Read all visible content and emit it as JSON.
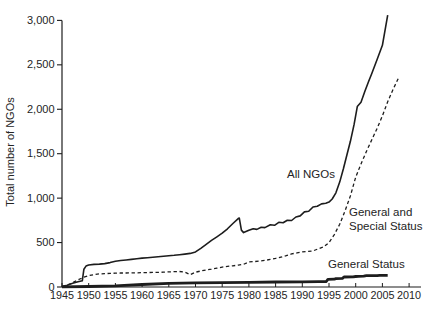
{
  "figure": {
    "background": "#ffffff",
    "ink_color": "#1d1d1d",
    "text_color": "#242424"
  },
  "chart_data": {
    "type": "line",
    "title": "",
    "xlabel": "",
    "ylabel": "Total number of NGOs",
    "xlim": [
      1945,
      2012
    ],
    "ylim": [
      0,
      3000
    ],
    "grid": false,
    "legend_position": "inline-annotations",
    "x_ticks": [
      1945,
      1950,
      1955,
      1960,
      1965,
      1970,
      1975,
      1980,
      1985,
      1990,
      1995,
      2000,
      2005,
      2010
    ],
    "x_tick_labels": [
      "1945",
      "1950",
      "1955",
      "1960",
      "1965",
      "1970",
      "1975",
      "1980",
      "1985",
      "1990",
      "1995",
      "2000",
      "2005",
      "2010"
    ],
    "y_ticks": [
      0,
      500,
      1000,
      1500,
      2000,
      2500,
      3000
    ],
    "y_tick_labels": [
      "0",
      "500",
      "1,000",
      "1,500",
      "2,000",
      "2,500",
      "3,000"
    ],
    "series": [
      {
        "name": "All NGOs",
        "style": "solid",
        "stroke_width": 1.6,
        "points": [
          [
            1945,
            5
          ],
          [
            1946,
            20
          ],
          [
            1947,
            42
          ],
          [
            1948,
            60
          ],
          [
            1948.8,
            70
          ],
          [
            1949.1,
            200
          ],
          [
            1949.5,
            235
          ],
          [
            1950,
            248
          ],
          [
            1951,
            254
          ],
          [
            1952,
            258
          ],
          [
            1953,
            263
          ],
          [
            1954,
            275
          ],
          [
            1955,
            290
          ],
          [
            1956,
            298
          ],
          [
            1957,
            304
          ],
          [
            1958,
            311
          ],
          [
            1959,
            317
          ],
          [
            1960,
            325
          ],
          [
            1961,
            330
          ],
          [
            1962,
            335
          ],
          [
            1963,
            340
          ],
          [
            1964,
            346
          ],
          [
            1965,
            352
          ],
          [
            1966,
            357
          ],
          [
            1967,
            363
          ],
          [
            1968,
            370
          ],
          [
            1969,
            378
          ],
          [
            1970,
            395
          ],
          [
            1971,
            435
          ],
          [
            1972,
            480
          ],
          [
            1973,
            525
          ],
          [
            1974,
            565
          ],
          [
            1975,
            605
          ],
          [
            1976,
            655
          ],
          [
            1977,
            715
          ],
          [
            1978,
            770
          ],
          [
            1978.2,
            775
          ],
          [
            1978.6,
            640
          ],
          [
            1979,
            612
          ],
          [
            1980,
            638
          ],
          [
            1980.8,
            656
          ],
          [
            1981.5,
            648
          ],
          [
            1982.3,
            672
          ],
          [
            1983,
            668
          ],
          [
            1984,
            700
          ],
          [
            1984.8,
            694
          ],
          [
            1985.6,
            728
          ],
          [
            1986.4,
            722
          ],
          [
            1987.2,
            752
          ],
          [
            1988,
            748
          ],
          [
            1988.8,
            788
          ],
          [
            1989.6,
            800
          ],
          [
            1990.4,
            845
          ],
          [
            1991.2,
            852
          ],
          [
            1992,
            900
          ],
          [
            1992.8,
            908
          ],
          [
            1993.6,
            935
          ],
          [
            1994.4,
            942
          ],
          [
            1995,
            955
          ],
          [
            1995.6,
            990
          ],
          [
            1996.3,
            1060
          ],
          [
            1997,
            1180
          ],
          [
            1997.7,
            1330
          ],
          [
            1998.4,
            1500
          ],
          [
            1999,
            1640
          ],
          [
            1999.7,
            1830
          ],
          [
            2000.3,
            2030
          ],
          [
            2001,
            2080
          ],
          [
            2001.7,
            2200
          ],
          [
            2002.4,
            2310
          ],
          [
            2003,
            2400
          ],
          [
            2004,
            2560
          ],
          [
            2005,
            2720
          ],
          [
            2006,
            3060
          ]
        ]
      },
      {
        "name": "General and Special Status",
        "style": "dashed",
        "stroke_width": 1.3,
        "points": [
          [
            1945,
            2
          ],
          [
            1946,
            24
          ],
          [
            1947,
            48
          ],
          [
            1948,
            80
          ],
          [
            1949,
            108
          ],
          [
            1950,
            128
          ],
          [
            1951,
            140
          ],
          [
            1952,
            147
          ],
          [
            1953,
            151
          ],
          [
            1954,
            153
          ],
          [
            1955,
            155
          ],
          [
            1956,
            157
          ],
          [
            1957,
            158
          ],
          [
            1958,
            159
          ],
          [
            1959,
            160
          ],
          [
            1960,
            161
          ],
          [
            1961,
            162
          ],
          [
            1962,
            164
          ],
          [
            1963,
            165
          ],
          [
            1964,
            167
          ],
          [
            1965,
            170
          ],
          [
            1966,
            172
          ],
          [
            1967,
            174
          ],
          [
            1968,
            168
          ],
          [
            1969,
            140
          ],
          [
            1970,
            167
          ],
          [
            1971,
            180
          ],
          [
            1972,
            191
          ],
          [
            1973,
            200
          ],
          [
            1974,
            212
          ],
          [
            1975,
            224
          ],
          [
            1976,
            232
          ],
          [
            1977,
            238
          ],
          [
            1978,
            246
          ],
          [
            1979,
            255
          ],
          [
            1980,
            281
          ],
          [
            1981,
            286
          ],
          [
            1982,
            291
          ],
          [
            1983,
            299
          ],
          [
            1984,
            311
          ],
          [
            1985,
            322
          ],
          [
            1986,
            336
          ],
          [
            1987,
            352
          ],
          [
            1988,
            372
          ],
          [
            1989,
            384
          ],
          [
            1990,
            395
          ],
          [
            1991,
            401
          ],
          [
            1992,
            406
          ],
          [
            1993,
            430
          ],
          [
            1994,
            452
          ],
          [
            1995,
            500
          ],
          [
            1996,
            590
          ],
          [
            1997,
            705
          ],
          [
            1998,
            855
          ],
          [
            1999,
            1025
          ],
          [
            2000,
            1235
          ],
          [
            2001,
            1385
          ],
          [
            2002,
            1525
          ],
          [
            2003,
            1655
          ],
          [
            2004,
            1785
          ],
          [
            2005,
            1925
          ],
          [
            2006,
            2085
          ],
          [
            2007,
            2225
          ],
          [
            2008,
            2350
          ]
        ]
      },
      {
        "name": "General Status",
        "style": "solid-thick",
        "stroke_width": 2.8,
        "points": [
          [
            1945,
            2
          ],
          [
            1950,
            6
          ],
          [
            1955,
            14
          ],
          [
            1960,
            28
          ],
          [
            1965,
            40
          ],
          [
            1970,
            46
          ],
          [
            1975,
            50
          ],
          [
            1980,
            53
          ],
          [
            1985,
            56
          ],
          [
            1990,
            58
          ],
          [
            1993,
            60
          ],
          [
            1994.5,
            62
          ],
          [
            1994.8,
            85
          ],
          [
            1996,
            88
          ],
          [
            1996.3,
            95
          ],
          [
            1997.5,
            97
          ],
          [
            1997.8,
            112
          ],
          [
            1999.5,
            114
          ],
          [
            2000,
            118
          ],
          [
            2000.5,
            120
          ],
          [
            2001.5,
            122
          ],
          [
            2002,
            127
          ],
          [
            2004,
            128
          ],
          [
            2004.5,
            130
          ],
          [
            2006,
            132
          ]
        ]
      }
    ],
    "annotations": [
      {
        "text": "All NGOs",
        "series": "All NGOs",
        "px": [
          287,
          178
        ]
      },
      {
        "text": "General and",
        "series": "General and Special Status",
        "px": [
          349,
          216
        ]
      },
      {
        "text": "Special Status",
        "series": "General and Special Status",
        "px": [
          349,
          230
        ]
      },
      {
        "text": "General Status",
        "series": "General Status",
        "px": [
          328,
          268
        ]
      }
    ]
  }
}
